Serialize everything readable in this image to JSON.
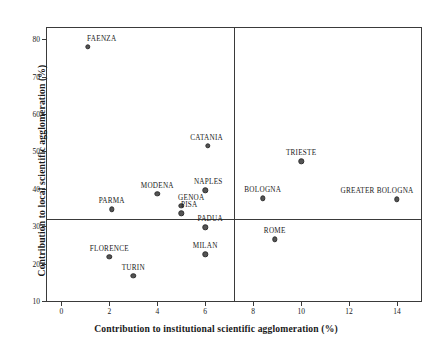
{
  "chart_data": {
    "type": "scatter",
    "title": "",
    "xlabel": "Contribution to institutional scientific agglomeration  (%)",
    "ylabel": "Contribution to local scientific agglomeration  (%)",
    "xlim": [
      -0.6,
      15.0
    ],
    "ylim": [
      10,
      83
    ],
    "xticks": [
      0,
      2,
      4,
      6,
      8,
      10,
      12,
      14
    ],
    "xtick_labels": [
      "0",
      "2",
      "4",
      "6",
      "8",
      "10",
      "12",
      "14"
    ],
    "yticks": [
      10,
      20,
      30,
      40,
      50,
      60,
      70,
      80
    ],
    "ytick_labels": [
      "10",
      "20",
      "30",
      "40",
      "50",
      "60",
      "70",
      "80"
    ],
    "grid": false,
    "legend": "none",
    "reference_lines": {
      "vertical_x": 7.2,
      "horizontal_y": 31.8
    },
    "points": [
      {
        "label": "FAENZA",
        "x": 1.1,
        "y": 77.9,
        "label_dx": 14,
        "label_dy": -4
      },
      {
        "label": "CATANIA",
        "x": 6.1,
        "y": 51.5,
        "label_dx": -1,
        "label_dy": -4
      },
      {
        "label": "TRIESTE",
        "x": 10.0,
        "y": 47.4,
        "label_dx": 0,
        "label_dy": -4
      },
      {
        "label": "NAPLES",
        "x": 6.0,
        "y": 39.6,
        "label_dx": 3,
        "label_dy": -4
      },
      {
        "label": "MODENA",
        "x": 4.0,
        "y": 38.7,
        "label_dx": 0,
        "label_dy": -4
      },
      {
        "label": "BOLOGNA",
        "x": 8.4,
        "y": 37.5,
        "label_dx": 0,
        "label_dy": -4
      },
      {
        "label": "GREATER BOLOGNA",
        "x": 14.0,
        "y": 37.2,
        "label_dx": -20,
        "label_dy": -4
      },
      {
        "label": "GENOA",
        "x": 5.0,
        "y": 35.5,
        "label_dx": 10,
        "label_dy": -4
      },
      {
        "label": "PARMA",
        "x": 2.1,
        "y": 34.5,
        "label_dx": 0,
        "label_dy": -4
      },
      {
        "label": "PISA",
        "x": 5.0,
        "y": 33.4,
        "label_dx": 8,
        "label_dy": -4
      },
      {
        "label": "PADUA",
        "x": 6.0,
        "y": 29.7,
        "label_dx": 5,
        "label_dy": -4
      },
      {
        "label": "ROME",
        "x": 8.9,
        "y": 26.5,
        "label_dx": 0,
        "label_dy": -4
      },
      {
        "label": "MILAN",
        "x": 6.0,
        "y": 22.5,
        "label_dx": 0,
        "label_dy": -4
      },
      {
        "label": "FLORENCE",
        "x": 2.0,
        "y": 21.8,
        "label_dx": 0,
        "label_dy": -4
      },
      {
        "label": "TURIN",
        "x": 3.0,
        "y": 16.8,
        "label_dx": 0,
        "label_dy": -4
      }
    ]
  }
}
